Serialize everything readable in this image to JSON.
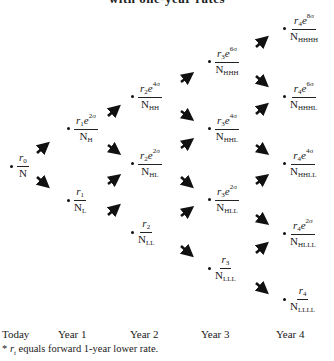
{
  "title": "with one-year rates",
  "nodes": {
    "today": {
      "r": "r",
      "r_sub": "0",
      "exp": "",
      "N": "N",
      "N_sub": ""
    },
    "y1_H": {
      "r": "r",
      "r_sub": "1",
      "exp": "2σ",
      "N": "N",
      "N_sub": "H"
    },
    "y1_L": {
      "r": "r",
      "r_sub": "1",
      "exp": "",
      "N": "N",
      "N_sub": "L"
    },
    "y2_HH": {
      "r": "r",
      "r_sub": "2",
      "exp": "4σ",
      "N": "N",
      "N_sub": "HH"
    },
    "y2_HL": {
      "r": "r",
      "r_sub": "2",
      "exp": "2σ",
      "N": "N",
      "N_sub": "HL"
    },
    "y2_LL": {
      "r": "r",
      "r_sub": "2",
      "exp": "",
      "N": "N",
      "N_sub": "LL"
    },
    "y3_HHH": {
      "r": "r",
      "r_sub": "3",
      "exp": "6σ",
      "N": "N",
      "N_sub": "HHH"
    },
    "y3_HHL": {
      "r": "r",
      "r_sub": "3",
      "exp": "4σ",
      "N": "N",
      "N_sub": "HHL"
    },
    "y3_HLL": {
      "r": "r",
      "r_sub": "3",
      "exp": "2σ",
      "N": "N",
      "N_sub": "HLL"
    },
    "y3_LLL": {
      "r": "r",
      "r_sub": "3",
      "exp": "",
      "N": "N",
      "N_sub": "LLL"
    },
    "y4_HHHH": {
      "r": "r",
      "r_sub": "4",
      "exp": "8σ",
      "N": "N",
      "N_sub": "HHHH"
    },
    "y4_HHHL": {
      "r": "r",
      "r_sub": "4",
      "exp": "6σ",
      "N": "N",
      "N_sub": "HHHL"
    },
    "y4_HHLL": {
      "r": "r",
      "r_sub": "4",
      "exp": "4σ",
      "N": "N",
      "N_sub": "HHLL"
    },
    "y4_HLLL": {
      "r": "r",
      "r_sub": "4",
      "exp": "2σ",
      "N": "N",
      "N_sub": "HLLL"
    },
    "y4_LLLL": {
      "r": "r",
      "r_sub": "4",
      "exp": "",
      "N": "N",
      "N_sub": "LLLL"
    }
  },
  "e": "e",
  "axis": {
    "today": "Today",
    "year1": "Year 1",
    "year2": "Year 2",
    "year3": "Year 3",
    "year4": "Year 4"
  },
  "footnote": {
    "star": "* ",
    "var": "r",
    "var_sub": "t",
    "text": " equals forward 1-year lower rate."
  }
}
